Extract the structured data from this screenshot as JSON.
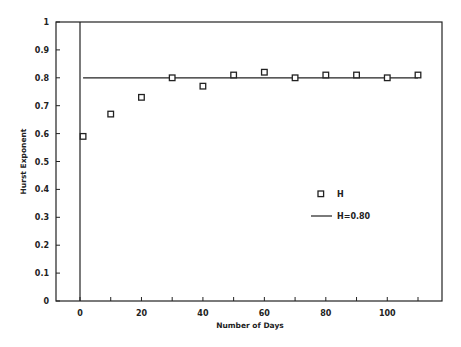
{
  "chart_data": {
    "type": "scatter",
    "title": "",
    "xlabel": "Number of Days",
    "ylabel": "Hurst Exponent",
    "xlim": [
      -8,
      118
    ],
    "ylim": [
      0,
      1
    ],
    "xticks": [
      0,
      10,
      20,
      30,
      40,
      50,
      60,
      70,
      80,
      90,
      100,
      110
    ],
    "xtick_labels": [
      "0",
      "",
      "20",
      "",
      "40",
      "",
      "60",
      "",
      "80",
      "",
      "100",
      ""
    ],
    "yticks": [
      0,
      0.1,
      0.2,
      0.3,
      0.4,
      0.5,
      0.6,
      0.7,
      0.8,
      0.9,
      1
    ],
    "ytick_labels": [
      "0",
      "0.1",
      "0.2",
      "0.3",
      "0.4",
      "0.5",
      "0.6",
      "0.7",
      "0.8",
      "0.9",
      "1"
    ],
    "grid": false,
    "vertical_reference_line_x": 0,
    "series": [
      {
        "name": "H",
        "marker": "open-square",
        "x": [
          1,
          10,
          20,
          30,
          40,
          50,
          60,
          70,
          80,
          90,
          100,
          110
        ],
        "y": [
          0.59,
          0.67,
          0.73,
          0.8,
          0.77,
          0.81,
          0.82,
          0.8,
          0.81,
          0.81,
          0.8,
          0.81
        ]
      },
      {
        "name": "H=0.80",
        "style": "line",
        "x": [
          1,
          110
        ],
        "y": [
          0.8,
          0.8
        ]
      }
    ],
    "legend": {
      "placement": "center-right",
      "entries": [
        "H",
        "H=0.80"
      ]
    }
  }
}
